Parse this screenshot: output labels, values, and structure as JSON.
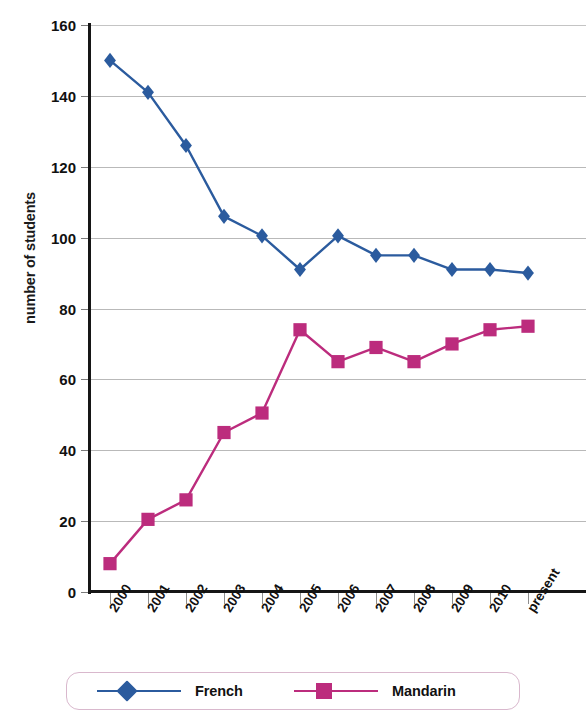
{
  "chart_data": {
    "type": "line",
    "title": "",
    "xlabel": "",
    "ylabel": "number of students",
    "categories": [
      "2000",
      "2001",
      "2002",
      "2003",
      "2004",
      "2005",
      "2006",
      "2007",
      "2008",
      "2009",
      "2010",
      "present"
    ],
    "ylim": [
      0,
      160
    ],
    "yticks": [
      0,
      20,
      40,
      60,
      80,
      100,
      120,
      140,
      160
    ],
    "grid": true,
    "legend_position": "bottom",
    "series": [
      {
        "name": "French",
        "color": "#2B5B9E",
        "marker": "diamond",
        "values": [
          150,
          141,
          126,
          106,
          100.5,
          91,
          100.5,
          95,
          95,
          91,
          91,
          90
        ]
      },
      {
        "name": "Mandarin",
        "color": "#BC2C7D",
        "marker": "square",
        "values": [
          8,
          20.5,
          26,
          45,
          50.5,
          74,
          65,
          69,
          65,
          70,
          74,
          75
        ]
      }
    ]
  },
  "axes": {
    "y_title": "number of students",
    "y_tick_labels": [
      "0",
      "20",
      "40",
      "60",
      "80",
      "100",
      "120",
      "140",
      "160"
    ],
    "x_tick_labels": [
      "2000",
      "2001",
      "2002",
      "2003",
      "2004",
      "2005",
      "2006",
      "2007",
      "2008",
      "2009",
      "2010",
      "present"
    ]
  },
  "legend": {
    "entries": [
      {
        "label": "French",
        "color": "#2B5B9E",
        "marker": "diamond"
      },
      {
        "label": "Mandarin",
        "color": "#BC2C7D",
        "marker": "square"
      }
    ]
  },
  "colors": {
    "french": "#2B5B9E",
    "mandarin": "#BC2C7D",
    "gridline": "#b9b9b9",
    "axis": "#161616",
    "legend_border": "#d9b8cd"
  }
}
